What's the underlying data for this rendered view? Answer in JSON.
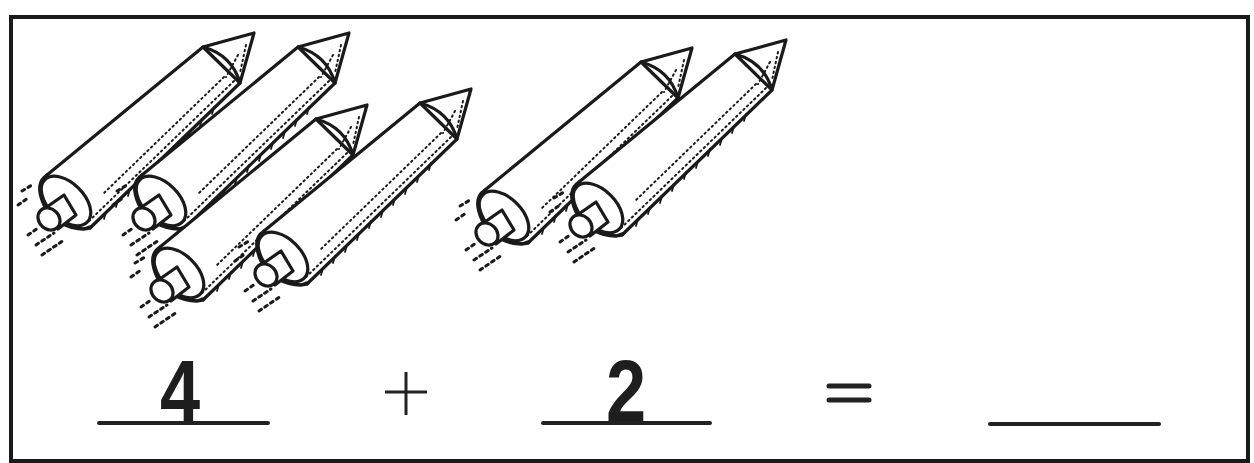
{
  "worksheet": {
    "title": "Rocket addition",
    "groups": [
      {
        "name": "first-addend-rockets",
        "count": 4
      },
      {
        "name": "second-addend-rockets",
        "count": 2
      }
    ],
    "equation": {
      "addend1": "4",
      "operator": "+",
      "addend2": "2",
      "equals": "=",
      "answer": ""
    },
    "icons": [
      "rocket-icon"
    ],
    "colors": {
      "ink": "#1e1e1e",
      "paper": "#ffffff"
    }
  }
}
